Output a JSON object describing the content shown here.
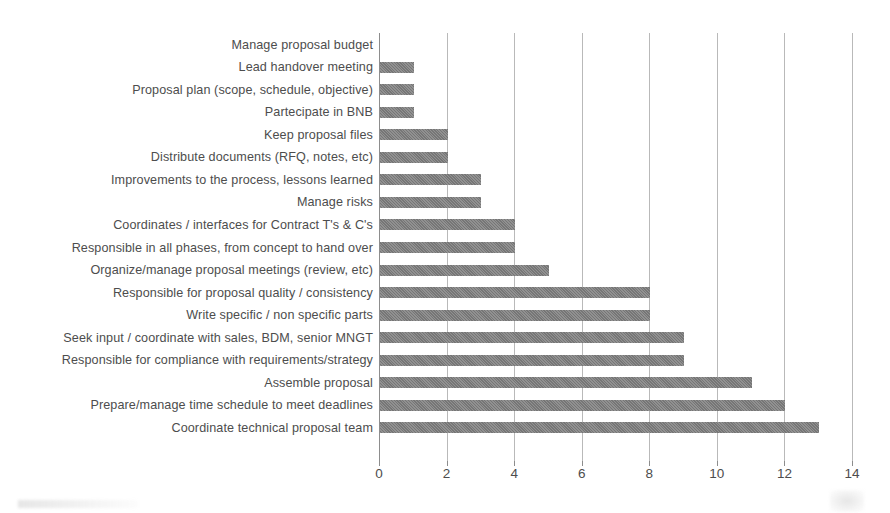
{
  "chart_data": {
    "type": "bar",
    "orientation": "horizontal",
    "title": "",
    "subtitle": "",
    "xlabel": "",
    "ylabel": "",
    "xlim": [
      0,
      14
    ],
    "xticks": [
      0,
      2,
      4,
      6,
      8,
      10,
      12,
      14
    ],
    "xtick_labels": [
      "0",
      "2",
      "4",
      "6",
      "8",
      "10",
      "12",
      "14"
    ],
    "grid": "vertical",
    "legend": "none",
    "bar_color": "#7c7c7c",
    "background_color": "#ffffff",
    "axis_color": "#8d8d8d",
    "gridline_color": "#b9b9b9",
    "text_color": "#4d4d4d",
    "categories": [
      "Manage proposal budget",
      "Lead handover meeting",
      "Proposal plan (scope, schedule, objective)",
      "Partecipate in BNB",
      "Keep proposal files",
      "Distribute documents (RFQ, notes, etc)",
      "Improvements to the process, lessons  learned",
      "Manage risks",
      "Coordinates / interfaces for Contract T's & C's",
      "Responsible in all phases, from concept to hand over",
      "Organize/manage proposal meetings (review, etc)",
      "Responsible for proposal quality / consistency",
      "Write specific / non specific parts",
      "Seek input / coordinate with sales, BDM, senior MNGT",
      "Responsible for compliance with  requirements/strategy",
      "Assemble proposal",
      "Prepare/manage time schedule to meet deadlines",
      "Coordinate technical proposal team"
    ],
    "values": [
      0,
      1,
      1,
      1,
      2,
      2,
      3,
      3,
      4,
      4,
      5,
      8,
      8,
      9,
      9,
      11,
      12,
      13
    ]
  }
}
